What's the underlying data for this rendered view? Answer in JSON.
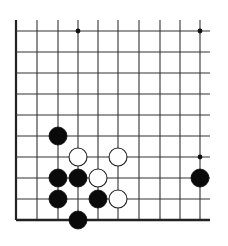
{
  "board": {
    "type": "go-diagram",
    "view": "bottom-left corner section",
    "columns": 10,
    "rows": 10,
    "col_x": [
      16,
      37,
      58,
      78,
      98,
      118,
      139,
      160,
      180,
      200
    ],
    "row_y": [
      31,
      52,
      73,
      94,
      115,
      136,
      157,
      178,
      199,
      220
    ],
    "top_open_y": 20,
    "right_open_x": 210,
    "left_edge": true,
    "bottom_edge": true,
    "line_color": "#333333",
    "edge_color": "#222222",
    "background": "#ffffff",
    "stone_radius": 9,
    "star_points": [
      {
        "col": 3,
        "row": 0
      },
      {
        "col": 9,
        "row": 0
      },
      {
        "col": 9,
        "row": 6
      }
    ],
    "stones": [
      {
        "color": "black",
        "col": 2,
        "row": 5
      },
      {
        "color": "white",
        "col": 3,
        "row": 6
      },
      {
        "color": "white",
        "col": 5,
        "row": 6
      },
      {
        "color": "black",
        "col": 2,
        "row": 7
      },
      {
        "color": "black",
        "col": 3,
        "row": 7
      },
      {
        "color": "white",
        "col": 4,
        "row": 7
      },
      {
        "color": "black",
        "col": 9,
        "row": 7
      },
      {
        "color": "black",
        "col": 2,
        "row": 8
      },
      {
        "color": "black",
        "col": 4,
        "row": 8
      },
      {
        "color": "white",
        "col": 5,
        "row": 8
      },
      {
        "color": "black",
        "col": 3,
        "row": 9
      }
    ]
  }
}
